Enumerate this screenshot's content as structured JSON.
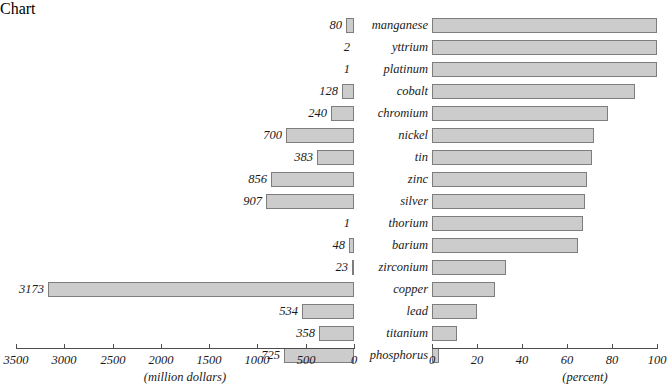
{
  "chart_data": {
    "type": "bar",
    "title": "",
    "orientation": "horizontal",
    "layout": "back-to-back paired bars (bidirectional population-pyramid style)",
    "categories": [
      "manganese",
      "yttrium",
      "platinum",
      "cobalt",
      "chromium",
      "nickel",
      "tin",
      "zinc",
      "silver",
      "thorium",
      "barium",
      "zirconium",
      "copper",
      "lead",
      "titanium",
      "phosphorus"
    ],
    "series": [
      {
        "name": "value",
        "unit": "million dollars",
        "axis": "left",
        "xlabel": "(million dollars)",
        "xlim": [
          3500,
          0
        ],
        "reversed": true,
        "ticks": [
          3500,
          3000,
          2500,
          2000,
          1500,
          1000,
          500,
          0
        ],
        "values": [
          80,
          2,
          1,
          128,
          240,
          700,
          383,
          856,
          907,
          1,
          48,
          23,
          3173,
          534,
          358,
          725
        ]
      },
      {
        "name": "imported",
        "unit": "percent",
        "axis": "right",
        "xlabel": "(percent)",
        "xlim": [
          0,
          100
        ],
        "ticks": [
          0,
          20,
          40,
          60,
          80,
          100
        ],
        "values": [
          100,
          100,
          100,
          90,
          78,
          72,
          71,
          69,
          68,
          67,
          65,
          33,
          28,
          20,
          11,
          3
        ]
      }
    ],
    "grid": false,
    "legend": false,
    "colors": {
      "bar_fill": "#cccccc",
      "bar_stroke": "#7d7d7d",
      "text": "#1a1a1a",
      "axis": "#4d4d4d"
    }
  },
  "rows": [
    {
      "name": "manganese",
      "value_label": "80",
      "value": 80,
      "percent": 100
    },
    {
      "name": "yttrium",
      "value_label": "2",
      "value": 2,
      "percent": 100
    },
    {
      "name": "platinum",
      "value_label": "1",
      "value": 1,
      "percent": 100
    },
    {
      "name": "cobalt",
      "value_label": "128",
      "value": 128,
      "percent": 90
    },
    {
      "name": "chromium",
      "value_label": "240",
      "value": 240,
      "percent": 78
    },
    {
      "name": "nickel",
      "value_label": "700",
      "value": 700,
      "percent": 72
    },
    {
      "name": "tin",
      "value_label": "383",
      "value": 383,
      "percent": 71
    },
    {
      "name": "zinc",
      "value_label": "856",
      "value": 856,
      "percent": 69
    },
    {
      "name": "silver",
      "value_label": "907",
      "value": 907,
      "percent": 68
    },
    {
      "name": "thorium",
      "value_label": "1",
      "value": 1,
      "percent": 67
    },
    {
      "name": "barium",
      "value_label": "48",
      "value": 48,
      "percent": 65
    },
    {
      "name": "zirconium",
      "value_label": "23",
      "value": 23,
      "percent": 33
    },
    {
      "name": "copper",
      "value_label": "3173",
      "value": 3173,
      "percent": 28
    },
    {
      "name": "lead",
      "value_label": "534",
      "value": 534,
      "percent": 20
    },
    {
      "name": "titanium",
      "value_label": "358",
      "value": 358,
      "percent": 11
    },
    {
      "name": "phosphorus",
      "value_label": "725",
      "value": 725,
      "percent": 3
    }
  ],
  "left_axis": {
    "title": "(million dollars)",
    "tick_labels": [
      "3500",
      "3000",
      "2500",
      "2000",
      "1500",
      "1000",
      "500",
      "0"
    ]
  },
  "right_axis": {
    "title": "(percent)",
    "tick_labels": [
      "0",
      "20",
      "40",
      "60",
      "80",
      "100"
    ]
  },
  "top_title": ""
}
